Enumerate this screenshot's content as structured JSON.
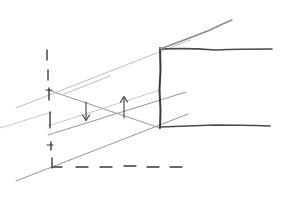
{
  "diagram": {
    "type": "hand-drawn-sketch",
    "colors": {
      "background": "#ffffff",
      "ink_dark": "#3a3a3a",
      "ink": "#4a4a4a",
      "ink_mid": "#8a8a8a",
      "ink_light": "#b8b8b8"
    },
    "elements": {
      "dashed_vertical_axis": {
        "x": 48,
        "y1": 48,
        "y2": 168
      },
      "dashed_horizontal_axis": {
        "y": 167,
        "x1": 52,
        "x2": 182
      },
      "box_vertical_edge": {
        "x": 160,
        "y1": 48,
        "y2": 128
      },
      "box_top_edge": {
        "y": 49,
        "x1": 160,
        "x2": 272
      },
      "box_bottom_edge": {
        "y": 127,
        "x1": 160,
        "x2": 270
      },
      "roof_diagonal": {
        "x1": 160,
        "y1": 49,
        "x2": 232,
        "y2": 20
      },
      "down_arrow": {
        "x": 86,
        "y1": 102,
        "y2": 120
      },
      "up_arrow": {
        "x": 124,
        "y1": 118,
        "y2": 97
      }
    }
  }
}
